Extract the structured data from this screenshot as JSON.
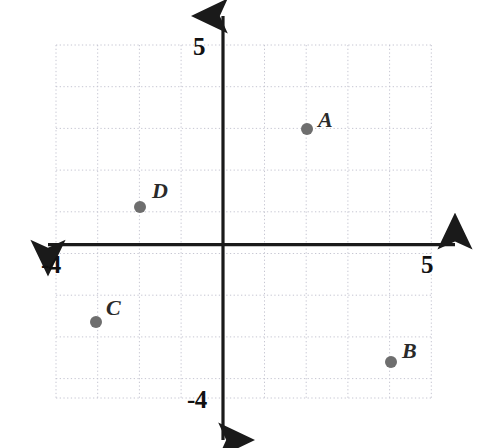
{
  "figure": {
    "kind": "coordinate-plane",
    "width": 483,
    "height": 448,
    "background_color": "#ffffff"
  },
  "axes": {
    "x_label_left": "-4",
    "x_label_right": "5",
    "y_label_top": "5",
    "y_label_bottom": "-4",
    "axis_color": "#1a1a1a",
    "grid_color": "#c9c9d6",
    "origin_px": {
      "x": 223,
      "y": 245
    },
    "pixels_per_unit": 41.7,
    "xlim": [
      -4,
      5
    ],
    "ylim": [
      -4,
      5
    ],
    "grid": true,
    "grid_style": "dotted"
  },
  "chart_data": {
    "type": "scatter",
    "title": "",
    "xlabel": "",
    "ylabel": "",
    "xlim": [
      -4,
      5
    ],
    "ylim": [
      -4,
      5
    ],
    "xticks": [
      -4,
      -3,
      -2,
      -1,
      0,
      1,
      2,
      3,
      4,
      5
    ],
    "yticks": [
      -4,
      -3,
      -2,
      -1,
      0,
      1,
      2,
      3,
      4,
      5
    ],
    "tick_labels_shown": [
      "-4",
      "5",
      "5",
      "-4"
    ],
    "grid": true,
    "legend": "none",
    "point_color": "#6e6e6e",
    "point_radius_px": 6,
    "points": [
      {
        "label": "A",
        "x": 2,
        "y": 3,
        "px": 307,
        "py": 129
      },
      {
        "label": "B",
        "x": 4,
        "y": -3,
        "px": 391,
        "py": 362
      },
      {
        "label": "C",
        "x": -3,
        "y": -2,
        "px": 96,
        "py": 322
      },
      {
        "label": "D",
        "x": -2,
        "y": 1,
        "px": 140,
        "py": 207
      }
    ]
  }
}
